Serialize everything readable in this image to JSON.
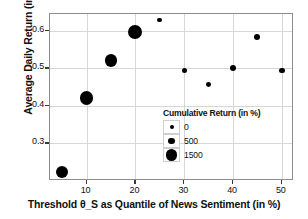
{
  "chart_data": {
    "type": "scatter",
    "title": "",
    "xlabel": "Threshold θ_S as Quantile of News Sentiment (in %)",
    "ylabel": "Average Daily Return (in %)",
    "xlim": [
      2.5,
      52.5
    ],
    "ylim": [
      0.2,
      0.645
    ],
    "grid": true,
    "xticks": [
      10,
      20,
      30,
      40,
      50
    ],
    "xtick_labels": [
      "10",
      "20",
      "30",
      "40",
      "50"
    ],
    "yticks": [
      0.3,
      0.4,
      0.5,
      0.6
    ],
    "ytick_labels": [
      "0.3",
      "0.4",
      "0.5",
      "0.6"
    ],
    "x": [
      5,
      10,
      15,
      20,
      25,
      30,
      35,
      40,
      45,
      50
    ],
    "y": [
      0.225,
      0.421,
      0.521,
      0.597,
      0.629,
      0.494,
      0.458,
      0.502,
      0.585,
      0.494
    ],
    "sizes": [
      1500,
      1750,
      1400,
      1800,
      170,
      180,
      170,
      230,
      230,
      200
    ],
    "marker_radii_px": [
      6.0,
      6.8,
      6.2,
      7.0,
      2.4,
      2.6,
      2.4,
      3.0,
      3.0,
      2.8
    ],
    "marker_color": "#000000",
    "series_name": "Cumulative Return (in %)",
    "legend_position": "inside-lower-right",
    "legend": {
      "title": "Cumulative Return (in %)",
      "entries": [
        {
          "label": "0",
          "radius_px": 2.0
        },
        {
          "label": "500",
          "radius_px": 3.4
        },
        {
          "label": "1500",
          "radius_px": 5.6
        }
      ]
    }
  },
  "axes": {
    "ylabel": "Average Daily Return (in %)",
    "xlabel": "Threshold θ_S as Quantile of News Sentiment (in %)"
  },
  "colors": {
    "marker": "#000000",
    "grid": "#d6d6d6",
    "frame": "#8d8d8d",
    "background": "#ffffff",
    "text": "#111111"
  }
}
